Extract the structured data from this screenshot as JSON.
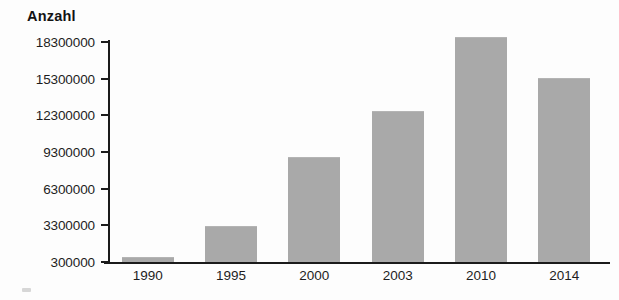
{
  "chart_data": {
    "type": "bar",
    "title": "",
    "ylabel": "Anzahl",
    "xlabel": "",
    "categories": [
      "1990",
      "1995",
      "2000",
      "2003",
      "2010",
      "2014"
    ],
    "values": [
      600000,
      3200000,
      8800000,
      12600000,
      18600000,
      15300000
    ],
    "ytick_labels": [
      "300000",
      "3300000",
      "6300000",
      "9300000",
      "12300000",
      "15300000",
      "18300000"
    ],
    "ytick_values": [
      300000,
      3300000,
      6300000,
      9300000,
      12300000,
      15300000,
      18300000
    ],
    "ylim": [
      300000,
      18300000
    ],
    "grid": false,
    "legend": "none",
    "bar_color": "#a9a9a9",
    "axis_color": "#1b1b1b"
  }
}
